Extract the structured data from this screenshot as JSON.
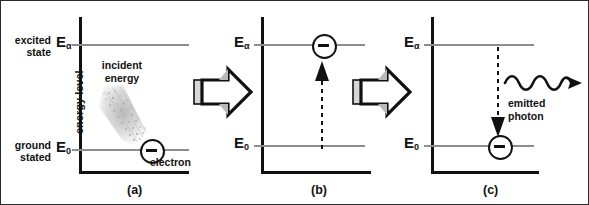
{
  "figure": {
    "caption_a": "(a)",
    "caption_b": "(b)",
    "caption_c": "(c)"
  },
  "labels": {
    "excited_state": "excited\nstate",
    "ground_state": "ground\nstated",
    "energy_axis": "energy level",
    "e_alpha": "E",
    "e_alpha_sub": "α",
    "e_zero": "E",
    "e_zero_sub": "0",
    "incident_energy": "incident\nenergy",
    "electron": "electron",
    "emitted_photon": "emitted\nphoton"
  },
  "colors": {
    "axis": "#111111",
    "level_line": "#8d8d8d",
    "arrow_outline": "#111111",
    "arrow_fill": "#ffffff",
    "arrow_shade": "#b9b9b9",
    "arrow_tail": "#d6d6d6",
    "beam": "#c9c9c9",
    "border": "#2b2b2b"
  },
  "diagram_data": {
    "type": "diagram",
    "subject": "Electron energy-level transition: absorption and photon emission",
    "levels": [
      {
        "name": "E",
        "subscript": "α",
        "state": "excited state",
        "relative_y": 0.2
      },
      {
        "name": "E",
        "subscript": "0",
        "state": "ground stated",
        "relative_y": 0.74
      }
    ],
    "panels": [
      {
        "caption": "(a)",
        "description": "Electron sits at ground level E0; incident energy beam arrives",
        "electron_level": "E0",
        "annotations": [
          "incident energy",
          "electron",
          "energy level"
        ]
      },
      {
        "caption": "(b)",
        "description": "Electron excited up to E-alpha, dashed upward arrow from E0 to E-alpha",
        "electron_level": "Eα",
        "transition": "up",
        "annotations": []
      },
      {
        "caption": "(c)",
        "description": "Electron relaxes down to E0, dashed downward arrow, wavy emitted photon leaves",
        "electron_level": "E0",
        "transition": "down",
        "annotations": [
          "emitted photon"
        ]
      }
    ],
    "connectors": [
      "block arrow a to b",
      "block arrow b to c"
    ]
  }
}
